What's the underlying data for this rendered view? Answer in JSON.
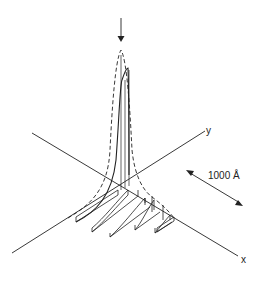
{
  "diagram": {
    "axes": {
      "x_label": "x",
      "y_label": "y"
    },
    "scale_bar": {
      "label": "1000 Å"
    },
    "elements": [
      "incident-beam-arrow",
      "dashed-peak-profile",
      "solid-peak-profile",
      "profile-slices"
    ],
    "colors": {
      "line": "#222222",
      "background": "#ffffff"
    }
  }
}
